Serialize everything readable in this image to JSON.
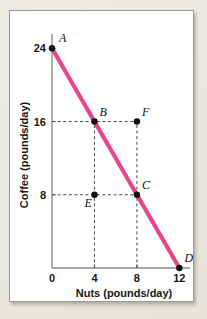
{
  "figure": {
    "kind": "production-possibilities-frontier",
    "panel_background": "#ffffff",
    "mat_background": "#e9e6dc",
    "panel_border_color": "#9a9a92"
  },
  "chart_data": {
    "type": "line",
    "title": "",
    "xlabel": "Nuts (pounds/day)",
    "ylabel": "Coffee (pounds/day)",
    "xlim": [
      0,
      13
    ],
    "ylim": [
      0,
      26
    ],
    "xticks": [
      "0",
      "4",
      "8",
      "12"
    ],
    "xtick_values": [
      0,
      4,
      8,
      12
    ],
    "yticks": [
      "24",
      "16",
      "8"
    ],
    "ytick_values": [
      24,
      16,
      8
    ],
    "grid": false,
    "legend": null,
    "series": [
      {
        "name": "Production possibilities frontier",
        "color": "#e8458a",
        "x": [
          0,
          12
        ],
        "y": [
          24,
          0
        ]
      }
    ],
    "points": [
      {
        "label": "A",
        "x": 0,
        "y": 24,
        "label_dx": 7,
        "label_dy": -6,
        "on_frontier": true
      },
      {
        "label": "B",
        "x": 4,
        "y": 16,
        "label_dx": 5,
        "label_dy": -6,
        "on_frontier": true
      },
      {
        "label": "F",
        "x": 8,
        "y": 16,
        "label_dx": 5,
        "label_dy": -6,
        "on_frontier": false
      },
      {
        "label": "E",
        "x": 4,
        "y": 8,
        "label_dx": -10,
        "label_dy": 12,
        "on_frontier": false
      },
      {
        "label": "C",
        "x": 8,
        "y": 8,
        "label_dx": 5,
        "label_dy": -6,
        "on_frontier": true
      },
      {
        "label": "D",
        "x": 12,
        "y": 0,
        "label_dx": 5,
        "label_dy": -6,
        "on_frontier": true
      }
    ],
    "guide_lines": [
      {
        "orientation": "horizontal",
        "value": 16,
        "from": 0,
        "to": 8
      },
      {
        "orientation": "horizontal",
        "value": 8,
        "from": 0,
        "to": 8
      },
      {
        "orientation": "vertical",
        "value": 4,
        "from": 0,
        "to": 16
      },
      {
        "orientation": "vertical",
        "value": 8,
        "from": 0,
        "to": 16
      }
    ],
    "annotations": []
  }
}
